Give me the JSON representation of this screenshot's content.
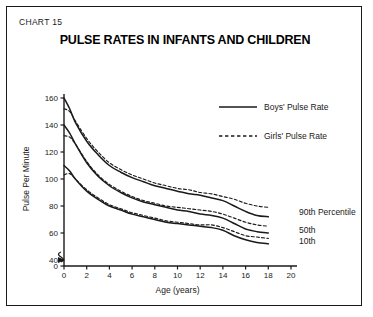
{
  "chart_label": "CHART 15",
  "title": "PULSE RATES IN INFANTS AND CHILDREN",
  "legend": {
    "boys": "Boys' Pulse Rate",
    "girls": "Girls' Pulse Rate"
  },
  "annotations": {
    "p90": "90th  Percentile",
    "p50": "50th",
    "p10": "10th"
  },
  "colors": {
    "ink": "#1a1a1a",
    "frame": "#1a1a1a",
    "background": "#ffffff"
  },
  "chart_data": {
    "type": "line",
    "title": "PULSE RATES IN INFANTS AND CHILDREN",
    "xlabel": "Age (years)",
    "ylabel": "Pulse Per Minute",
    "xlim": [
      0,
      20
    ],
    "ylim": [
      40,
      160
    ],
    "y_axis_break": true,
    "y_break_between": [
      0,
      40
    ],
    "xticks": [
      0,
      2,
      4,
      6,
      8,
      10,
      12,
      14,
      16,
      18,
      20
    ],
    "yticks": [
      0,
      40,
      60,
      80,
      100,
      120,
      140,
      160
    ],
    "grid": false,
    "legend_position": "upper-right",
    "x": [
      0,
      0.5,
      1,
      2,
      3,
      4,
      5,
      6,
      7,
      8,
      9,
      10,
      11,
      12,
      13,
      14,
      15,
      16,
      17,
      18
    ],
    "series": [
      {
        "name": "Boys' Pulse Rate - 90th Percentile",
        "sex": "boys",
        "percentile": 90,
        "style": "solid",
        "values": [
          160,
          152,
          142,
          128,
          118,
          110,
          105,
          101,
          98,
          95,
          93,
          91,
          89,
          88,
          86,
          84,
          80,
          76,
          73,
          72
        ]
      },
      {
        "name": "Girls' Pulse Rate - 90th Percentile",
        "sex": "girls",
        "percentile": 90,
        "style": "dashed",
        "values": [
          152,
          150,
          143,
          130,
          120,
          112,
          107,
          103,
          100,
          97,
          95,
          93,
          92,
          90,
          89,
          87,
          85,
          82,
          80,
          79
        ]
      },
      {
        "name": "Boys' Pulse Rate - 50th Percentile",
        "sex": "boys",
        "percentile": 50,
        "style": "solid",
        "values": [
          140,
          134,
          126,
          112,
          102,
          95,
          90,
          86,
          83,
          81,
          79,
          77,
          76,
          74,
          73,
          71,
          67,
          63,
          61,
          60
        ]
      },
      {
        "name": "Girls' Pulse Rate - 50th Percentile",
        "sex": "girls",
        "percentile": 50,
        "style": "dashed",
        "values": [
          132,
          131,
          126,
          113,
          103,
          96,
          91,
          87,
          84,
          82,
          80,
          79,
          78,
          77,
          76,
          74,
          71,
          68,
          66,
          65
        ]
      },
      {
        "name": "Boys' Pulse Rate - 10th Percentile",
        "sex": "boys",
        "percentile": 10,
        "style": "solid",
        "values": [
          110,
          106,
          100,
          91,
          85,
          80,
          77,
          74,
          72,
          70,
          68,
          67,
          66,
          65,
          64,
          62,
          58,
          55,
          53,
          52
        ]
      },
      {
        "name": "Girls' Pulse Rate - 10th Percentile",
        "sex": "girls",
        "percentile": 10,
        "style": "dashed",
        "values": [
          103,
          104,
          100,
          92,
          86,
          81,
          78,
          75,
          73,
          71,
          69,
          68,
          67,
          66,
          66,
          64,
          61,
          58,
          57,
          56
        ]
      }
    ]
  }
}
